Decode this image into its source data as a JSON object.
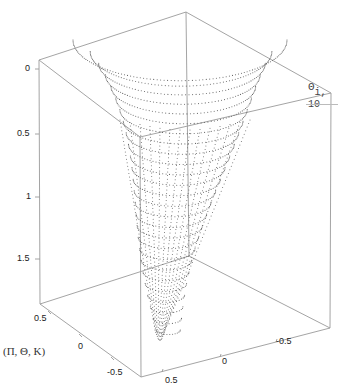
{
  "chart_data": {
    "type": "scatter3d",
    "title": "",
    "legend": [
      {
        "name": "Θ i,10",
        "symbol": "Θ",
        "subscript": "i,10"
      }
    ],
    "axes": {
      "z": {
        "ticks": [
          "0",
          "0.5",
          "1",
          "1.5"
        ],
        "range": [
          0,
          1.8
        ],
        "inverted": true
      },
      "x": {
        "ticks": [
          "0.5",
          "0",
          "-0.5"
        ],
        "range": [
          -0.6,
          0.6
        ]
      },
      "y": {
        "ticks": [
          "0.5",
          "0",
          "-0.5"
        ],
        "range": [
          -0.6,
          0.6
        ]
      }
    },
    "axis_label": "(Π, Θ, K)",
    "grid": false,
    "box": true
  },
  "labels": {
    "z_ticks": [
      "0",
      "0.5",
      "1",
      "1.5"
    ],
    "left_ticks": [
      "0.5",
      "0",
      "-0.5"
    ],
    "right_ticks": [
      "0.5",
      "0",
      "-0.5"
    ],
    "legend_symbol": "Θ",
    "legend_sub": "i, 10",
    "axis_label": "(Π, Θ, K)"
  }
}
